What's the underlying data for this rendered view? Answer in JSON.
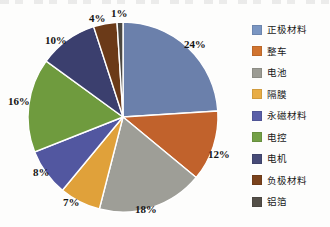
{
  "chart_data": {
    "type": "pie",
    "title": "",
    "labels": [
      "正极材料",
      "整车",
      "电池",
      "隔膜",
      "永磁材料",
      "电控",
      "电机",
      "负极材料",
      "铝箔"
    ],
    "values": [
      24,
      12,
      18,
      7,
      8,
      16,
      10,
      4,
      1
    ],
    "value_labels": [
      "24%",
      "12%",
      "18%",
      "7%",
      "8%",
      "16%",
      "10%",
      "4%",
      "1%"
    ],
    "colors": [
      "#6b80ab",
      "#c1622c",
      "#9e9e97",
      "#e0a13a",
      "#5257a0",
      "#6f9b3e",
      "#3b3f6e",
      "#6b3a18",
      "#4b4741"
    ],
    "start_angle_deg": 0,
    "direction": "clockwise",
    "legend_position": "right",
    "grid": false,
    "unit": "%",
    "slice_border_color": "#ffffff"
  },
  "legend": {
    "items": [
      {
        "label": "正极材料",
        "color": "#7a96c2"
      },
      {
        "label": "整车",
        "color": "#d1742f"
      },
      {
        "label": "电池",
        "color": "#9c9c94"
      },
      {
        "label": "隔膜",
        "color": "#e8ad46"
      },
      {
        "label": "永磁材料",
        "color": "#5a5fa8"
      },
      {
        "label": "电控",
        "color": "#73a046"
      },
      {
        "label": "电机",
        "color": "#474b77"
      },
      {
        "label": "负极材料",
        "color": "#7a421c"
      },
      {
        "label": "铝箔",
        "color": "#544f48"
      }
    ]
  },
  "pie_labels": [
    {
      "text": "24%",
      "left": 184,
      "top": 38
    },
    {
      "text": "12%",
      "left": 208,
      "top": 148
    },
    {
      "text": "18%",
      "left": 135,
      "top": 203
    },
    {
      "text": "7%",
      "left": 63,
      "top": 196
    },
    {
      "text": "8%",
      "left": 33,
      "top": 166
    },
    {
      "text": "16%",
      "left": 8,
      "top": 95
    },
    {
      "text": "10%",
      "left": 45,
      "top": 34
    },
    {
      "text": "4%",
      "left": 89,
      "top": 12
    },
    {
      "text": "1%",
      "left": 111,
      "top": 7
    }
  ]
}
